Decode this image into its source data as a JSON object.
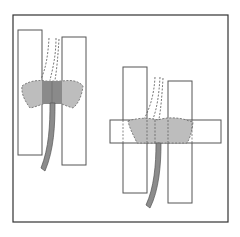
{
  "figure": {
    "title": "",
    "colors": {
      "frame": "#333333",
      "outline": "#555555",
      "blob_light": "#bdbdbd",
      "blob_dark": "#8a8a8a",
      "fiber": "#8c8c8c",
      "background": "#ffffff"
    },
    "panels": [
      {
        "name": "left-panel",
        "label": ""
      },
      {
        "name": "right-panel",
        "label": ""
      }
    ]
  }
}
